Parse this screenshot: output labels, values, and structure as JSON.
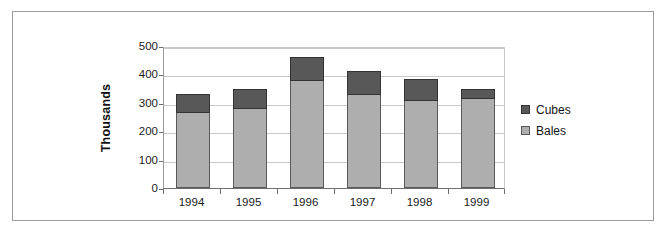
{
  "chart_data": {
    "type": "bar",
    "subtype": "stacked-column",
    "title": "",
    "xlabel": "",
    "ylabel": "Thousands",
    "categories": [
      "1994",
      "1995",
      "1996",
      "1997",
      "1998",
      "1999"
    ],
    "series": [
      {
        "name": "Bales",
        "color": "#aeaeae",
        "values": [
          265,
          277,
          378,
          327,
          305,
          312
        ]
      },
      {
        "name": "Cubes",
        "color": "#585858",
        "values": [
          65,
          73,
          82,
          85,
          80,
          38
        ]
      }
    ],
    "totals": [
      330,
      350,
      460,
      412,
      385,
      350
    ],
    "stack_order": [
      "Bales",
      "Cubes"
    ],
    "ylim": [
      0,
      500
    ],
    "yticks": [
      0,
      100,
      200,
      300,
      400,
      500
    ],
    "ytick_labels": [
      "0",
      "100",
      "200",
      "300",
      "400",
      "500"
    ],
    "grid": true,
    "grid_axis": "y",
    "legend_position": "right",
    "legend": [
      {
        "label": "Cubes",
        "color": "#585858"
      },
      {
        "label": "Bales",
        "color": "#aeaeae"
      }
    ]
  },
  "figure": {
    "border_color": "#9a9a9a",
    "background": "#ffffff"
  }
}
